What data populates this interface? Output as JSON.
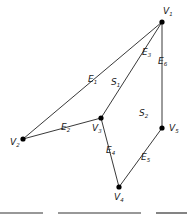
{
  "diagram": {
    "type": "planar-graph",
    "vertices": [
      {
        "id": "V1",
        "base": "V",
        "sub": "1",
        "x": 162,
        "y": 22,
        "lx": 163,
        "ly": 14
      },
      {
        "id": "V2",
        "base": "V",
        "sub": "2",
        "x": 23,
        "y": 139,
        "lx": 10,
        "ly": 145
      },
      {
        "id": "V3",
        "base": "V",
        "sub": "3",
        "x": 101,
        "y": 118,
        "lx": 92,
        "ly": 131
      },
      {
        "id": "V4",
        "base": "V",
        "sub": "4",
        "x": 119,
        "y": 187,
        "lx": 114,
        "ly": 200
      },
      {
        "id": "V5",
        "base": "V",
        "sub": "5",
        "x": 162,
        "y": 128,
        "lx": 169,
        "ly": 131
      }
    ],
    "edges": [
      {
        "id": "E1",
        "base": "E",
        "sub": "1",
        "from": "V1",
        "to": "V2",
        "lx": 88,
        "ly": 82
      },
      {
        "id": "E2",
        "base": "E",
        "sub": "2",
        "from": "V2",
        "to": "V3",
        "lx": 61,
        "ly": 130
      },
      {
        "id": "E3",
        "base": "E",
        "sub": "3",
        "from": "V1",
        "to": "V3",
        "lx": 142,
        "ly": 55
      },
      {
        "id": "E4",
        "base": "E",
        "sub": "4",
        "from": "V3",
        "to": "V4",
        "lx": 106,
        "ly": 153
      },
      {
        "id": "E5",
        "base": "E",
        "sub": "5",
        "from": "V4",
        "to": "V5",
        "lx": 141,
        "ly": 160
      },
      {
        "id": "E6",
        "base": "E",
        "sub": "6",
        "from": "V1",
        "to": "V5",
        "lx": 158,
        "ly": 64
      }
    ],
    "faces": [
      {
        "id": "S1",
        "base": "S",
        "sub": "1",
        "lx": 111,
        "ly": 85
      },
      {
        "id": "S2",
        "base": "S",
        "sub": "2",
        "lx": 139,
        "ly": 116
      }
    ],
    "rules": [
      {
        "x1": 0,
        "x2": 43,
        "y": 213
      },
      {
        "x1": 58,
        "x2": 141,
        "y": 213
      },
      {
        "x1": 156,
        "x2": 187,
        "y": 213
      }
    ]
  }
}
